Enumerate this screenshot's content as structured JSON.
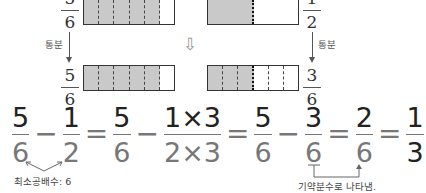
{
  "diagram": {
    "top_left": {
      "numerator": "5",
      "denominator": "6",
      "parts": 6,
      "filled": 5
    },
    "top_right": {
      "numerator": "1",
      "denominator": "2",
      "parts": 2,
      "filled": 1
    },
    "bottom_left": {
      "numerator": "5",
      "denominator": "6",
      "parts": 6,
      "filled": 5
    },
    "bottom_right": {
      "numerator": "3",
      "denominator": "6",
      "parts": 6,
      "filled": 3
    },
    "left_arrow_label": "통분",
    "right_arrow_label": "통분",
    "center_arrow": "⇩",
    "fill_color": "#c9c9c9"
  },
  "equation": {
    "terms": [
      {
        "n": "5",
        "d": "6"
      },
      {
        "op": "−"
      },
      {
        "n": "1",
        "d": "2"
      },
      {
        "op": "="
      },
      {
        "n": "5",
        "d": "6"
      },
      {
        "op": "−"
      },
      {
        "n": "1×3",
        "d": "2×3"
      },
      {
        "op": "="
      },
      {
        "n": "5",
        "d": "6"
      },
      {
        "op": "−"
      },
      {
        "n": "3",
        "d": "6"
      },
      {
        "op": "="
      },
      {
        "n": "2",
        "d": "6"
      },
      {
        "op": "="
      },
      {
        "n": "1",
        "d": "3"
      }
    ],
    "lcm_note": "최소공배수: 6",
    "reduce_note": "기약분수로 나타냄."
  }
}
